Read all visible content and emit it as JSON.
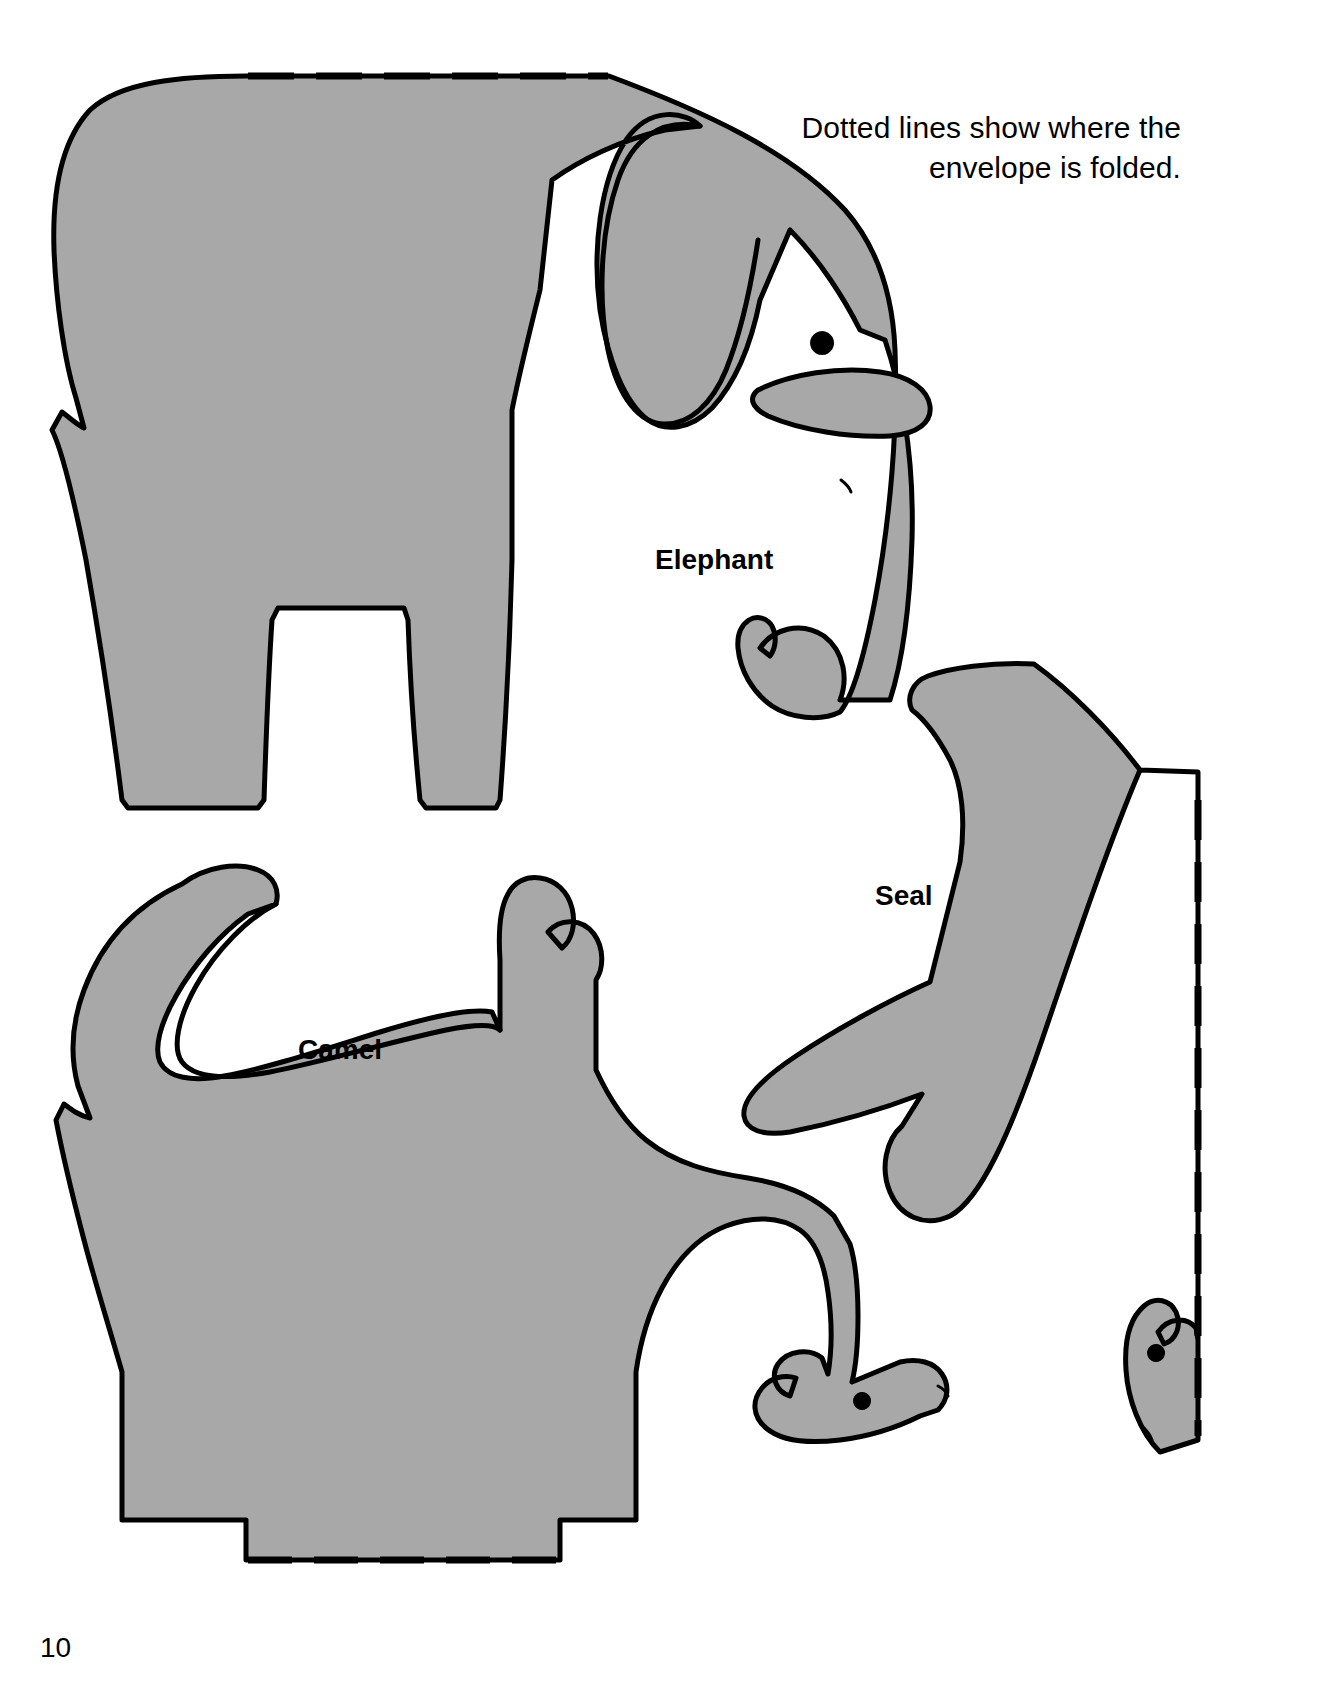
{
  "page": {
    "number": "10",
    "background_color": "#ffffff",
    "ink_color": "#000000",
    "shape_fill_color": "#a8a8a8"
  },
  "caption": {
    "text": "Dotted lines show where the envelope is folded.",
    "alignment": "right"
  },
  "shapes": [
    {
      "id": "elephant",
      "label": "Elephant",
      "fill": "#a8a8a8",
      "stroke": "#000000",
      "has_fold_line": true,
      "fold_line_position": "top"
    },
    {
      "id": "camel",
      "label": "Camel",
      "fill": "#a8a8a8",
      "stroke": "#000000",
      "has_fold_line": true,
      "fold_line_position": "bottom"
    },
    {
      "id": "seal",
      "label": "Seal",
      "fill": "#a8a8a8",
      "stroke": "#000000",
      "has_fold_line": true,
      "fold_line_position": "right"
    }
  ]
}
